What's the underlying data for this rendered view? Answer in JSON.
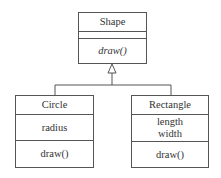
{
  "diagram": {
    "type": "UML class diagram",
    "parent": {
      "name": "Shape",
      "attributes": [],
      "operations": [
        "draw()"
      ],
      "operations_italic": true
    },
    "children": [
      {
        "name": "Circle",
        "attributes": [
          "radius"
        ],
        "operations": [
          "draw()"
        ]
      },
      {
        "name": "Rectangle",
        "attributes": [
          "length",
          "width"
        ],
        "operations": [
          "draw()"
        ]
      }
    ],
    "relationship": "generalization (inheritance)",
    "colors": {
      "line": "#555555",
      "background": "#ffffff",
      "text": "#333333"
    }
  }
}
